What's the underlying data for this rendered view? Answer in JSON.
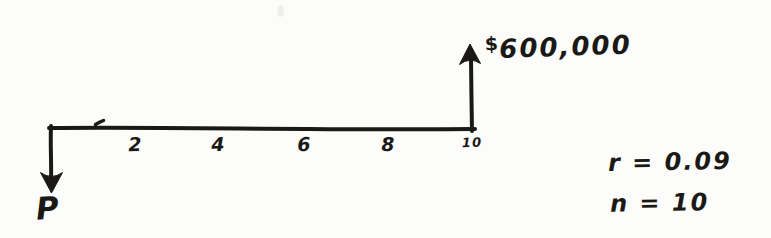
{
  "colors": {
    "ink": "#1b1916",
    "paper": "#fcfcfb"
  },
  "diagram": {
    "type": "cash-flow-timeline",
    "axis": {
      "ticks": [
        "2",
        "4",
        "6",
        "8",
        "10"
      ]
    },
    "present": {
      "label": "P",
      "direction": "down"
    },
    "future": {
      "currency": "$",
      "amount": "600,000",
      "at_tick": "10",
      "direction": "up"
    },
    "annotations": {
      "rate": "r = 0.09",
      "periods": "n = 10"
    }
  }
}
